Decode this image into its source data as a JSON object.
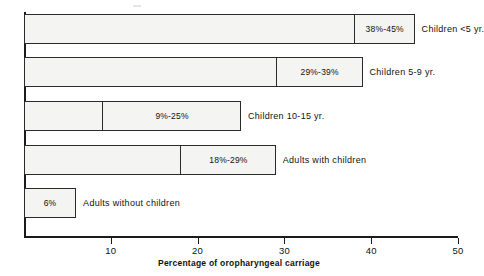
{
  "chart_data": {
    "type": "bar",
    "title": "",
    "subtitle": "",
    "xlabel": "Percentage of oropharyngeal carriage",
    "ylabel": "",
    "xlim": [
      0,
      50
    ],
    "ylim": null,
    "grid": false,
    "legend": null,
    "orientation": "horizontal",
    "note": "Each bar shows a range of oropharyngeal carriage percentages; the shaded end segment spans the low-to-high value.",
    "categories": [
      "Children <5 yr.",
      "Children 5-9 yr.",
      "Children 10-15 yr.",
      "Adults with children",
      "Adults without children"
    ],
    "range_labels": [
      "38%-45%",
      "29%-39%",
      "9%-25%",
      "18%-29%",
      "6%"
    ],
    "low_values": [
      38,
      29,
      9,
      18,
      6
    ],
    "high_values": [
      45,
      39,
      25,
      29,
      6
    ],
    "ticks": [
      {
        "value": 10,
        "label": "10"
      },
      {
        "value": 20,
        "label": "20"
      },
      {
        "value": 30,
        "label": "30"
      },
      {
        "value": 40,
        "label": "40"
      },
      {
        "value": 50,
        "label": "50"
      }
    ],
    "bars": [
      {
        "category": "Children <5 yr.",
        "range_label": "38%-45%",
        "low": 38,
        "high": 45
      },
      {
        "category": "Children 5-9 yr.",
        "range_label": "29%-39%",
        "low": 29,
        "high": 39
      },
      {
        "category": "Children 10-15 yr.",
        "range_label": "9%-25%",
        "low": 9,
        "high": 25
      },
      {
        "category": "Adults with children",
        "range_label": "18%-29%",
        "low": 18,
        "high": 29
      },
      {
        "category": "Adults without children",
        "range_label": "6%",
        "low": 0,
        "high": 6
      }
    ],
    "colors": {
      "bar_fill": "#f4f4f2",
      "bar_stroke": "#2a2a2a",
      "axis": "#1b1b1b",
      "text": "#111111",
      "background": "#ffffff"
    }
  }
}
